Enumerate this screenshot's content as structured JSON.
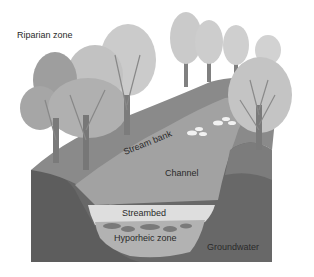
{
  "diagram": {
    "labels": {
      "riparian_zone": "Riparian zone",
      "stream_bank": "Stream bank",
      "channel": "Channel",
      "streambed": "Streambed",
      "hyporheic_zone": "Hyporheic zone",
      "groundwater": "Groundwater"
    },
    "colors": {
      "background": "#ffffff",
      "groundwater": "#6f6f6f",
      "ground_front": "#5f5f5f",
      "land_surface": "#8c8c8c",
      "channel": "#a3a3a3",
      "streambed": "#dcdcdc",
      "hyporheic": "#b3b3b3",
      "tree_crown_light": "#c9c9c9",
      "tree_crown_dark": "#9c9c9c",
      "trunk": "#7a7a7a",
      "rocks": "#efefef"
    }
  }
}
